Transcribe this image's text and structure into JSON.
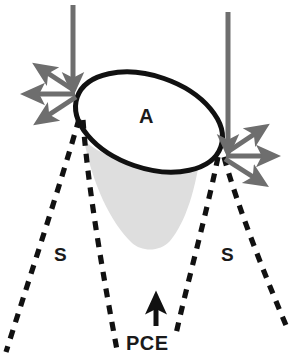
{
  "figure": {
    "type": "schematic-diagram",
    "background_color": "#ffffff"
  },
  "labels": {
    "aperture": "A",
    "sheath_left": "S",
    "sheath_right": "S",
    "pce": "PCE"
  },
  "colors": {
    "outline": "#111111",
    "arrow_gray": "#6e6e6e",
    "cone_fill": "#dedede",
    "dashed_line": "#111111",
    "text": "#1a1a1a",
    "ellipse_fill": "#ffffff"
  },
  "geometry": {
    "ellipse": {
      "center_x": 149,
      "center_y": 122,
      "radius_x": 76,
      "radius_y": 46,
      "rotation_deg": 19,
      "stroke_width": 5
    },
    "cone": {
      "apex_tip_y": 246,
      "top_left_x": 84,
      "top_right_x": 200
    }
  },
  "elements": {
    "incoming_arrow_left": {
      "name": "vertical-down-arrow",
      "x": 73,
      "y_start": 5,
      "y_end": 90
    },
    "incoming_arrow_right": {
      "name": "vertical-down-arrow",
      "x": 228,
      "y_start": 12,
      "y_end": 152
    },
    "diverging_arrows_left": [
      {
        "direction": "upper-left"
      },
      {
        "direction": "left"
      },
      {
        "direction": "lower-left"
      }
    ],
    "diverging_arrows_right": [
      {
        "direction": "upper-right"
      },
      {
        "direction": "right"
      },
      {
        "direction": "lower-right"
      }
    ],
    "dashed_lines": [
      {
        "from": "left-vertex",
        "direction": "down-left"
      },
      {
        "from": "left-vertex",
        "direction": "down-right"
      },
      {
        "from": "right-vertex",
        "direction": "down-left"
      },
      {
        "from": "right-vertex",
        "direction": "down-right"
      }
    ],
    "pce_arrow": {
      "name": "up-arrow",
      "x": 156,
      "y_start": 325,
      "y_end": 297
    }
  }
}
